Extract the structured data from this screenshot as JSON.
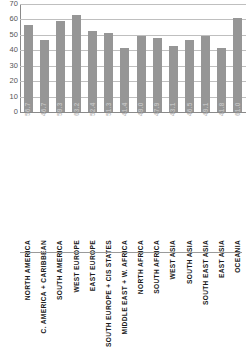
{
  "chart_data": {
    "type": "bar",
    "title": "",
    "subtitle": "",
    "xlabel": "",
    "ylabel": "",
    "ylim": [
      0,
      70
    ],
    "ytick_step": 10,
    "yticks": [
      "70",
      "60",
      "50",
      "40",
      "30",
      "20",
      "10",
      "0"
    ],
    "grid": true,
    "legend": false,
    "bar_color": "#969696",
    "value_label_color": "#c2c2c2",
    "categories": [
      "NORTH AMERICA",
      "C. AMERICA + CARIBBEAN",
      "SOUTH AMERICA",
      "WEST EUROPE",
      "EAST EUROPE",
      "SOUTH EUROPE + CIS STATES",
      "MIDDLE EAST + W. AFRICA",
      "NORTH AFRICA",
      "SOUTH AFRICA",
      "WEST ASIA",
      "SOUTH ASIA",
      "SOUTH EAST ASIA",
      "EAST ASIA",
      "OCEANIA"
    ],
    "values": [
      56.7,
      46.7,
      59.3,
      63.2,
      52.4,
      51.3,
      41.4,
      49.0,
      47.9,
      43.1,
      46.5,
      49.1,
      41.8,
      61.0
    ],
    "value_labels": [
      "56.7",
      "46.7",
      "59.3",
      "63.2",
      "52.4",
      "51.3",
      "41.4",
      "49.0",
      "47.9",
      "43.1",
      "46.5",
      "49.1",
      "41.8",
      "61.0"
    ]
  }
}
